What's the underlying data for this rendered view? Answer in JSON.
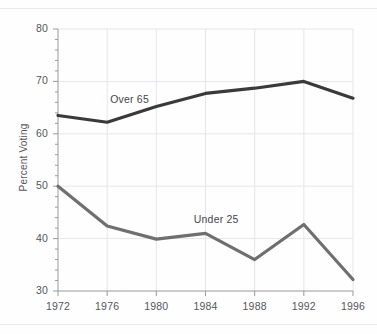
{
  "chart_data": {
    "type": "line",
    "title": "",
    "subtitle": "",
    "xlabel": "",
    "ylabel": "Percent Voting",
    "x": [
      1972,
      1976,
      1980,
      1984,
      1988,
      1992,
      1996
    ],
    "categories": [
      "1972",
      "1976",
      "1980",
      "1984",
      "1988",
      "1992",
      "1996"
    ],
    "xlim": [
      1972,
      1996
    ],
    "ylim": [
      30,
      80
    ],
    "y_major_ticks": [
      30,
      40,
      50,
      60,
      70,
      80
    ],
    "y_minor_tick_step": 2,
    "y_tick_labels": [
      "30",
      "40",
      "50",
      "60",
      "70",
      "80"
    ],
    "x_tick_labels": [
      "1972",
      "1976",
      "1980",
      "1984",
      "1988",
      "1992",
      "1996"
    ],
    "grid": true,
    "grid_axis": "both",
    "legend": "inline-labels",
    "series": [
      {
        "name": "Over 65",
        "label": "Over 65",
        "color": "#3a3a3a",
        "values": [
          63.5,
          62.2,
          65.2,
          67.7,
          68.7,
          70.0,
          66.8
        ]
      },
      {
        "name": "Under 25",
        "label": "Under 25",
        "color": "#6f6f6f",
        "values": [
          50.0,
          42.4,
          39.9,
          41.0,
          36.0,
          42.7,
          32.2
        ]
      }
    ],
    "annotations": [
      {
        "text": "Over 65",
        "x": 1978.2,
        "y": 66.4
      },
      {
        "text": "Under 25",
        "x": 1985.0,
        "y": 43.6
      }
    ]
  },
  "axes": {
    "y_axis_title": "Percent Voting"
  },
  "style": {
    "background": "#fefefe",
    "grid_color": "#e6e6e8",
    "axis_color": "#9a9a9e",
    "tick_text_color": "#55565a",
    "rule_color": "#e9eaec"
  }
}
